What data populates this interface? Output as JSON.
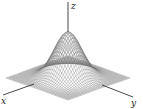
{
  "figure": {
    "surface_function": "z = exp(-(x^2 + y^2))",
    "domain": {
      "x": [
        -2.2,
        2.2
      ],
      "y": [
        -2.2,
        2.2
      ]
    },
    "grid_lines": 40,
    "colors": {
      "axis": "#333333",
      "mesh": "#777777",
      "background": "#ffffff"
    }
  },
  "axes": {
    "x_label": "x",
    "y_label": "y",
    "z_label": "z"
  }
}
